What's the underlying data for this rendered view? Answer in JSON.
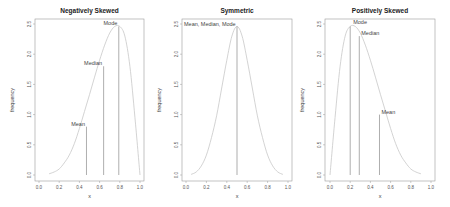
{
  "chart_data": [
    {
      "type": "line",
      "title": "Negatively Skewed",
      "xlabel": "x",
      "ylabel": "frequency",
      "xlim": [
        0.0,
        1.0
      ],
      "ylim": [
        0.0,
        2.5
      ],
      "xticks": [
        "0.0",
        "0.2",
        "0.4",
        "0.6",
        "0.8",
        "1.0"
      ],
      "yticks": [
        "0.0",
        "0.5",
        "1.0",
        "1.5",
        "2.0",
        "2.5"
      ],
      "grid": false,
      "curve": {
        "x": [
          0.1,
          0.15,
          0.2,
          0.25,
          0.3,
          0.35,
          0.4,
          0.45,
          0.5,
          0.55,
          0.6,
          0.65,
          0.7,
          0.75,
          0.8,
          0.85,
          0.9,
          0.95,
          1.0
        ],
        "y": [
          0.02,
          0.05,
          0.1,
          0.2,
          0.33,
          0.52,
          0.77,
          1.05,
          1.33,
          1.62,
          1.9,
          2.15,
          2.35,
          2.46,
          2.46,
          2.3,
          1.8,
          0.95,
          0.0
        ]
      },
      "annotations": [
        {
          "label": "Mean",
          "x": 0.47,
          "y": 0.8
        },
        {
          "label": "Median",
          "x": 0.64,
          "y": 1.8
        },
        {
          "label": "Mode",
          "x": 0.79,
          "y": 2.46
        }
      ]
    },
    {
      "type": "line",
      "title": "Symmetric",
      "xlabel": "x",
      "ylabel": "frequency",
      "xlim": [
        0.0,
        1.0
      ],
      "ylim": [
        0.0,
        2.5
      ],
      "xticks": [
        "0.0",
        "0.2",
        "0.4",
        "0.6",
        "0.8",
        "1.0"
      ],
      "yticks": [
        "0.0",
        "0.5",
        "1.0",
        "1.5",
        "2.0",
        "2.5"
      ],
      "grid": false,
      "curve": {
        "x": [
          0.05,
          0.1,
          0.15,
          0.2,
          0.25,
          0.3,
          0.35,
          0.4,
          0.45,
          0.5,
          0.55,
          0.6,
          0.65,
          0.7,
          0.75,
          0.8,
          0.85,
          0.9,
          0.95
        ],
        "y": [
          0.01,
          0.05,
          0.15,
          0.33,
          0.62,
          0.98,
          1.44,
          1.9,
          2.3,
          2.46,
          2.3,
          1.9,
          1.44,
          0.98,
          0.62,
          0.33,
          0.15,
          0.05,
          0.01
        ]
      },
      "annotations": [
        {
          "label": "Mean, Median, Mode",
          "x": 0.5,
          "y": 2.46
        }
      ]
    },
    {
      "type": "line",
      "title": "Positively Skewed",
      "xlabel": "x",
      "ylabel": "frequency",
      "xlim": [
        0.0,
        1.0
      ],
      "ylim": [
        0.0,
        2.5
      ],
      "xticks": [
        "0.0",
        "0.2",
        "0.4",
        "0.6",
        "0.8",
        "1.0"
      ],
      "yticks": [
        "0.0",
        "0.5",
        "1.0",
        "1.5",
        "2.0",
        "2.5"
      ],
      "grid": false,
      "curve": {
        "x": [
          0.0,
          0.05,
          0.1,
          0.15,
          0.2,
          0.25,
          0.3,
          0.35,
          0.4,
          0.45,
          0.5,
          0.55,
          0.6,
          0.65,
          0.7,
          0.75,
          0.8,
          0.85,
          0.9
        ],
        "y": [
          0.0,
          0.95,
          1.8,
          2.3,
          2.46,
          2.46,
          2.35,
          2.15,
          1.9,
          1.62,
          1.33,
          1.05,
          0.77,
          0.52,
          0.33,
          0.2,
          0.1,
          0.05,
          0.02
        ]
      },
      "annotations": [
        {
          "label": "Mode",
          "x": 0.2,
          "y": 2.46
        },
        {
          "label": "Median",
          "x": 0.29,
          "y": 2.3
        },
        {
          "label": "Mean",
          "x": 0.49,
          "y": 1.0
        }
      ]
    }
  ],
  "layout": {
    "panels": [
      {
        "box": [
          35,
          19,
          144,
          181
        ],
        "xpx0": 39,
        "xpx1": 140
      },
      {
        "box": [
          182,
          19,
          292,
          181
        ],
        "xpx0": 186,
        "xpx1": 288
      },
      {
        "box": [
          325,
          19,
          435,
          181
        ],
        "xpx0": 330,
        "xpx1": 431
      }
    ],
    "ypx0": 175,
    "ypx1": 24,
    "colors": {
      "curve": "#c8c8c8",
      "vline": "#777777",
      "box": "#9a9a9a"
    }
  }
}
